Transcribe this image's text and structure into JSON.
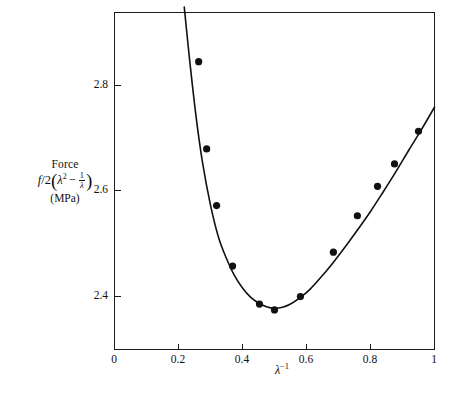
{
  "chart_data": {
    "type": "scatter",
    "title": "",
    "subtitle": "",
    "xlabel": "λ⁻¹",
    "ylabel": "Force f/2(λ² − 1/λ) (MPa)",
    "xlim": [
      0,
      1
    ],
    "ylim": [
      2.29,
      2.92
    ],
    "grid": false,
    "legend": "none",
    "xticks": [
      "0",
      "0.2",
      "0.4",
      "0.6",
      "0.8",
      "1"
    ],
    "xtick_values": [
      0,
      0.2,
      0.4,
      0.6,
      0.8,
      1
    ],
    "yticks": [
      "2.4",
      "2.6",
      "2.8"
    ],
    "ytick_values": [
      2.4,
      2.6,
      2.8
    ],
    "series": [
      {
        "name": "Measured force data",
        "marker": "filled-circle",
        "color": "#111111",
        "x": [
          0.263,
          0.288,
          0.319,
          0.369,
          0.453,
          0.5,
          0.581,
          0.684,
          0.759,
          0.822,
          0.875,
          0.95
        ],
        "y": [
          2.828,
          2.665,
          2.559,
          2.446,
          2.375,
          2.364,
          2.389,
          2.472,
          2.54,
          2.595,
          2.637,
          2.698
        ]
      },
      {
        "name": "Fitted Mooney-Rivlin curve",
        "marker": "none",
        "color": "#111111",
        "x": [
          0.218,
          0.235,
          0.255,
          0.275,
          0.3,
          0.325,
          0.35,
          0.375,
          0.4,
          0.425,
          0.45,
          0.475,
          0.5,
          0.525,
          0.55,
          0.58,
          0.61,
          0.645,
          0.68,
          0.72,
          0.76,
          0.8,
          0.84,
          0.88,
          0.92,
          0.96,
          1.0
        ],
        "y": [
          2.93,
          2.83,
          2.725,
          2.64,
          2.56,
          2.5,
          2.46,
          2.428,
          2.405,
          2.388,
          2.377,
          2.37,
          2.367,
          2.369,
          2.375,
          2.387,
          2.402,
          2.425,
          2.45,
          2.481,
          2.514,
          2.548,
          2.585,
          2.623,
          2.663,
          2.702,
          2.743
        ]
      }
    ]
  },
  "axis_labels": {
    "y_line1": "Force",
    "y_formula_f": "f",
    "y_formula_slash": "/",
    "y_formula_two": "2",
    "y_formula_open": "(",
    "y_formula_lambda": "λ",
    "y_formula_sup": "2",
    "y_formula_minus": "−",
    "y_formula_frac_num": "1",
    "y_formula_frac_den": "λ",
    "y_formula_close": ")",
    "y_line3": "(MPa)",
    "x_lambda": "λ",
    "x_exponent": "−1"
  }
}
